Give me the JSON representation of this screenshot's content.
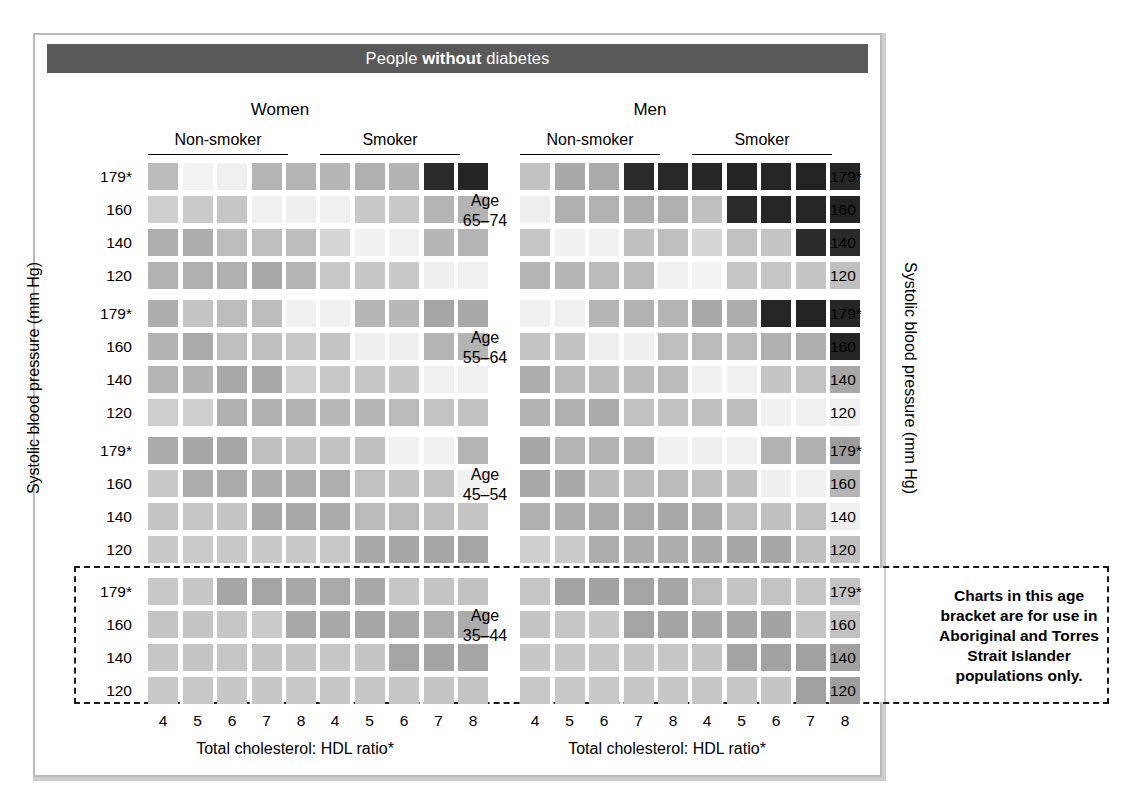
{
  "title": {
    "prefix": "People ",
    "emphasis": "without",
    "suffix": " diabetes",
    "full": "People without diabetes",
    "bar_color": "#595959"
  },
  "axes": {
    "y_title_left": "Systolic blood pressure (mm Hg)",
    "y_title_right": "Systolic blood pressure (mm Hg)",
    "x_title_women": "Total cholesterol: HDL ratio*",
    "x_title_men": "Total cholesterol: HDL ratio*",
    "y_ticks": [
      "179*",
      "160",
      "140",
      "120"
    ],
    "x_ticks": [
      "4",
      "5",
      "6",
      "7",
      "8"
    ]
  },
  "sex_headers": [
    {
      "label": "Women"
    },
    {
      "label": "Men"
    }
  ],
  "smoking_headers": [
    {
      "label": "Non-smoker"
    },
    {
      "label": "Smoker"
    },
    {
      "label": "Non-smoker"
    },
    {
      "label": "Smoker"
    }
  ],
  "age_groups": [
    {
      "line1": "Age",
      "line2": "65–74"
    },
    {
      "line1": "Age",
      "line2": "55–64"
    },
    {
      "line1": "Age",
      "line2": "45–54"
    },
    {
      "line1": "Age",
      "line2": "35–44"
    }
  ],
  "note": {
    "text": "Charts in this age bracket are for use in Aboriginal and Torres Strait Islander populations only.",
    "line1": "Charts in this age",
    "line2": "bracket are for use in",
    "line3": "Aboriginal and Torres",
    "line4": "Strait Islander",
    "line5": "populations only."
  },
  "risk_palette": {
    "note": "Grayscale risk bands as rendered in this scanned chart, lightest (lowest risk) to darkest (highest risk)",
    "levels": [
      "#f2f2f2",
      "#e8e8e8",
      "#d8d8d8",
      "#c9c9c9",
      "#bcbcbc",
      "#ababab",
      "#9b9b9b",
      "#8c8c8c",
      "#2e2e2e",
      "#232323"
    ]
  },
  "chart_data": {
    "type": "heatmap",
    "title": "People without diabetes",
    "xlabel": "Total cholesterol: HDL ratio*",
    "ylabel": "Systolic blood pressure (mm Hg)",
    "x": [
      "4",
      "5",
      "6",
      "7",
      "8"
    ],
    "y": [
      "179*",
      "160",
      "140",
      "120"
    ],
    "grid": false,
    "legend": "none",
    "value_scale": "cell fill is a grayscale risk shade; value = hex fill sampled from the scan",
    "panels": [
      {
        "sex": "Women",
        "smoking": "Non-smoker",
        "age": "65–74",
        "rows": [
          {
            "sbp": "179*",
            "cells": [
              "#bcbcbc",
              "#f2f2f2",
              "#f0f0f0",
              "#b4b4b4",
              "#b4b4b4"
            ]
          },
          {
            "sbp": "160",
            "cells": [
              "#cfcfcf",
              "#cacaca",
              "#c6c6c6",
              "#f0f0f0",
              "#efefef"
            ]
          },
          {
            "sbp": "140",
            "cells": [
              "#aeaeae",
              "#adadad",
              "#bdbdbd",
              "#bfbfbf",
              "#bdbdbd"
            ]
          },
          {
            "sbp": "120",
            "cells": [
              "#b2b2b2",
              "#b0b0b0",
              "#b0b0b0",
              "#a8a8a8",
              "#b4b4b4"
            ]
          }
        ]
      },
      {
        "sex": "Women",
        "smoking": "Smoker",
        "age": "65–74",
        "rows": [
          {
            "sbp": "179*",
            "cells": [
              "#b6b6b6",
              "#b0b0b0",
              "#b3b3b3",
              "#2b2b2b",
              "#252525"
            ]
          },
          {
            "sbp": "160",
            "cells": [
              "#f0f0f0",
              "#c8c8c8",
              "#c8c8c8",
              "#b4b4b4",
              "#b3b3b3"
            ]
          },
          {
            "sbp": "140",
            "cells": [
              "#d6d6d6",
              "#f1f1f1",
              "#f0f0f0",
              "#b6b6b6",
              "#b4b4b4"
            ]
          },
          {
            "sbp": "120",
            "cells": [
              "#c8c8c8",
              "#c7c7c7",
              "#c9c9c9",
              "#efefef",
              "#f0f0f0"
            ]
          }
        ]
      },
      {
        "sex": "Men",
        "smoking": "Non-smoker",
        "age": "65–74",
        "rows": [
          {
            "sbp": "179*",
            "cells": [
              "#c2c2c2",
              "#a9a9a9",
              "#ababab",
              "#2b2b2b",
              "#282828"
            ]
          },
          {
            "sbp": "160",
            "cells": [
              "#eeeeee",
              "#b0b0b0",
              "#b1b1b1",
              "#aeaeae",
              "#b0b0b0"
            ]
          },
          {
            "sbp": "140",
            "cells": [
              "#c6c6c6",
              "#f1f1f1",
              "#f1f1f1",
              "#c0c0c0",
              "#bebebe"
            ]
          },
          {
            "sbp": "120",
            "cells": [
              "#b5b5b5",
              "#b6b6b6",
              "#bababa",
              "#bababa",
              "#f1f1f1"
            ]
          }
        ]
      },
      {
        "sex": "Men",
        "smoking": "Smoker",
        "age": "65–74",
        "rows": [
          {
            "sbp": "179*",
            "cells": [
              "#272727",
              "#242424",
              "#262626",
              "#232323",
              "#252525"
            ]
          },
          {
            "sbp": "160",
            "cells": [
              "#c0c0c0",
              "#2a2a2a",
              "#262626",
              "#272727",
              "#242424"
            ]
          },
          {
            "sbp": "140",
            "cells": [
              "#d6d6d6",
              "#c1c1c1",
              "#c4c4c4",
              "#2b2b2b",
              "#2a2a2a"
            ]
          },
          {
            "sbp": "120",
            "cells": [
              "#f3f3f3",
              "#c6c6c6",
              "#c6c6c6",
              "#c4c4c4",
              "#c0c0c0"
            ]
          }
        ]
      },
      {
        "sex": "Women",
        "smoking": "Non-smoker",
        "age": "55–64",
        "rows": [
          {
            "sbp": "179*",
            "cells": [
              "#adadad",
              "#c4c4c4",
              "#bdbdbd",
              "#bdbdbd",
              "#f1f1f1"
            ]
          },
          {
            "sbp": "160",
            "cells": [
              "#b3b3b3",
              "#aaaaaa",
              "#bfbfbf",
              "#c0c0c0",
              "#c8c8c8"
            ]
          },
          {
            "sbp": "140",
            "cells": [
              "#b4b4b4",
              "#b3b3b3",
              "#a8a8a8",
              "#a8a8a8",
              "#d0d0d0"
            ]
          },
          {
            "sbp": "120",
            "cells": [
              "#cdcdcd",
              "#cfcfcf",
              "#b0b0b0",
              "#b0b0b0",
              "#b2b2b2"
            ]
          }
        ]
      },
      {
        "sex": "Women",
        "smoking": "Smoker",
        "age": "55–64",
        "rows": [
          {
            "sbp": "179*",
            "cells": [
              "#f1f1f1",
              "#b6b6b6",
              "#b8b8b8",
              "#a6a6a6",
              "#a9a9a9"
            ]
          },
          {
            "sbp": "160",
            "cells": [
              "#c4c4c4",
              "#efefef",
              "#efefef",
              "#b5b5b5",
              "#b4b4b4"
            ]
          },
          {
            "sbp": "140",
            "cells": [
              "#c8c8c8",
              "#c6c6c6",
              "#c7c7c7",
              "#f0f0f0",
              "#f0f0f0"
            ]
          },
          {
            "sbp": "120",
            "cells": [
              "#b8b8b8",
              "#b6b6b6",
              "#b9b9b9",
              "#c3c3c3",
              "#c2c2c2"
            ]
          }
        ]
      },
      {
        "sex": "Men",
        "smoking": "Non-smoker",
        "age": "55–64",
        "rows": [
          {
            "sbp": "179*",
            "cells": [
              "#f1f1f1",
              "#f0f0f0",
              "#b5b5b5",
              "#b2b2b2",
              "#b4b4b4"
            ]
          },
          {
            "sbp": "160",
            "cells": [
              "#c4c4c4",
              "#c2c2c2",
              "#eeeeee",
              "#efefef",
              "#bebebe"
            ]
          },
          {
            "sbp": "140",
            "cells": [
              "#adadad",
              "#bababa",
              "#bcbcbc",
              "#bcbcbc",
              "#bababa"
            ]
          },
          {
            "sbp": "120",
            "cells": [
              "#b3b3b3",
              "#afafaf",
              "#aaaaaa",
              "#c1c1c1",
              "#c2c2c2"
            ]
          }
        ]
      },
      {
        "sex": "Men",
        "smoking": "Smoker",
        "age": "55–64",
        "rows": [
          {
            "sbp": "179*",
            "cells": [
              "#a8a8a8",
              "#adadad",
              "#262626",
              "#232323",
              "#252525"
            ]
          },
          {
            "sbp": "160",
            "cells": [
              "#bababa",
              "#bababa",
              "#b0b0b0",
              "#aeaeae",
              "#242424"
            ]
          },
          {
            "sbp": "140",
            "cells": [
              "#f1f1f1",
              "#f0f0f0",
              "#c4c4c4",
              "#c3c3c3",
              "#a8a8a8"
            ]
          },
          {
            "sbp": "120",
            "cells": [
              "#c0c0c0",
              "#bdbdbd",
              "#f1f1f1",
              "#f0f0f0",
              "#f0f0f0"
            ]
          }
        ]
      },
      {
        "sex": "Women",
        "smoking": "Non-smoker",
        "age": "45–54",
        "rows": [
          {
            "sbp": "179*",
            "cells": [
              "#ababab",
              "#a7a7a7",
              "#a5a5a5",
              "#c0c0c0",
              "#c2c2c2"
            ]
          },
          {
            "sbp": "160",
            "cells": [
              "#c8c8c8",
              "#acacac",
              "#aaaaaa",
              "#adadad",
              "#acacac"
            ]
          },
          {
            "sbp": "140",
            "cells": [
              "#c5c5c5",
              "#c6c6c6",
              "#c5c5c5",
              "#a9a9a9",
              "#a9a9a9"
            ]
          },
          {
            "sbp": "120",
            "cells": [
              "#c9c9c9",
              "#cacaca",
              "#c8c8c8",
              "#c9c9c9",
              "#c8c8c8"
            ]
          }
        ]
      },
      {
        "sex": "Women",
        "smoking": "Smoker",
        "age": "45–54",
        "rows": [
          {
            "sbp": "179*",
            "cells": [
              "#c2c2c2",
              "#c0c0c0",
              "#f1f1f1",
              "#f0f0f0",
              "#b5b5b5"
            ]
          },
          {
            "sbp": "160",
            "cells": [
              "#aeaeae",
              "#c1c1c1",
              "#c2c2c2",
              "#c2c2c2",
              "#f1f1f1"
            ]
          },
          {
            "sbp": "140",
            "cells": [
              "#ababab",
              "#b9b9b9",
              "#b9b9b9",
              "#bfbfbf",
              "#c4c4c4"
            ]
          },
          {
            "sbp": "120",
            "cells": [
              "#c8c8c8",
              "#a9a9a9",
              "#a7a7a7",
              "#a6a6a6",
              "#a5a5a5"
            ]
          }
        ]
      },
      {
        "sex": "Men",
        "smoking": "Non-smoker",
        "age": "45–54",
        "rows": [
          {
            "sbp": "179*",
            "cells": [
              "#a7a7a7",
              "#b4b4b4",
              "#b3b3b3",
              "#b2b2b2",
              "#f1f1f1"
            ]
          },
          {
            "sbp": "160",
            "cells": [
              "#a9a9a9",
              "#a9a9a9",
              "#bcbcbc",
              "#bcbcbc",
              "#bababa"
            ]
          },
          {
            "sbp": "140",
            "cells": [
              "#b0b0b0",
              "#adadad",
              "#ababab",
              "#aaaaaa",
              "#a9a9a9"
            ]
          },
          {
            "sbp": "120",
            "cells": [
              "#cfcfcf",
              "#cacaca",
              "#acacac",
              "#adadad",
              "#acacac"
            ]
          }
        ]
      },
      {
        "sex": "Men",
        "smoking": "Smoker",
        "age": "45–54",
        "rows": [
          {
            "sbp": "179*",
            "cells": [
              "#eeeeee",
              "#f0f0f0",
              "#b1b1b1",
              "#b0b0b0",
              "#9d9d9d"
            ]
          },
          {
            "sbp": "160",
            "cells": [
              "#c0c0c0",
              "#c0c0c0",
              "#efefef",
              "#f0f0f0",
              "#b5b5b5"
            ]
          },
          {
            "sbp": "140",
            "cells": [
              "#acacac",
              "#bebebe",
              "#c0c0c0",
              "#c1c1c1",
              "#f0f0f0"
            ]
          },
          {
            "sbp": "120",
            "cells": [
              "#aaaaaa",
              "#a6a6a6",
              "#a6a6a6",
              "#bfbfbf",
              "#c0c0c0"
            ]
          }
        ]
      },
      {
        "sex": "Women",
        "smoking": "Non-smoker",
        "age": "35–44",
        "rows": [
          {
            "sbp": "179*",
            "cells": [
              "#c8c8c8",
              "#c7c7c7",
              "#a6a6a6",
              "#a5a5a5",
              "#a8a8a8"
            ]
          },
          {
            "sbp": "160",
            "cells": [
              "#c4c4c4",
              "#c5c5c5",
              "#c6c6c6",
              "#cacaca",
              "#a8a8a8"
            ]
          },
          {
            "sbp": "140",
            "cells": [
              "#c6c6c6",
              "#c5c5c5",
              "#c6c6c6",
              "#c5c5c5",
              "#c4c4c4"
            ]
          },
          {
            "sbp": "120",
            "cells": [
              "#c8c8c8",
              "#c8c8c8",
              "#c7c7c7",
              "#c7c7c7",
              "#c8c8c8"
            ]
          }
        ]
      },
      {
        "sex": "Women",
        "smoking": "Smoker",
        "age": "35–44",
        "rows": [
          {
            "sbp": "179*",
            "cells": [
              "#aaaaaa",
              "#a9a9a9",
              "#c6c6c6",
              "#c4c4c4",
              "#c2c2c2"
            ]
          },
          {
            "sbp": "160",
            "cells": [
              "#a9a9a9",
              "#a7a7a7",
              "#a8a8a8",
              "#aeaeae",
              "#acacac"
            ]
          },
          {
            "sbp": "140",
            "cells": [
              "#c6c6c6",
              "#c5c5c5",
              "#a5a5a5",
              "#a4a4a4",
              "#a6a6a6"
            ]
          },
          {
            "sbp": "120",
            "cells": [
              "#c7c7c7",
              "#c6c6c6",
              "#c6c6c6",
              "#c5c5c5",
              "#c4c4c4"
            ]
          }
        ]
      },
      {
        "sex": "Men",
        "smoking": "Non-smoker",
        "age": "35–44",
        "rows": [
          {
            "sbp": "179*",
            "cells": [
              "#c6c6c6",
              "#a4a4a4",
              "#a3a3a3",
              "#a5a5a5",
              "#a6a6a6"
            ]
          },
          {
            "sbp": "160",
            "cells": [
              "#c5c5c5",
              "#c6c6c6",
              "#c7c7c7",
              "#a5a5a5",
              "#a4a4a4"
            ]
          },
          {
            "sbp": "140",
            "cells": [
              "#c7c7c7",
              "#c6c6c6",
              "#c6c6c6",
              "#c5c5c5",
              "#c6c6c6"
            ]
          },
          {
            "sbp": "120",
            "cells": [
              "#c8c8c8",
              "#c8c8c8",
              "#c8c8c8",
              "#c7c7c7",
              "#c7c7c7"
            ]
          }
        ]
      },
      {
        "sex": "Men",
        "smoking": "Smoker",
        "age": "35–44",
        "rows": [
          {
            "sbp": "179*",
            "cells": [
              "#bebebe",
              "#c4c4c4",
              "#c3c3c3",
              "#c6c6c6",
              "#c4c4c4"
            ]
          },
          {
            "sbp": "160",
            "cells": [
              "#a8a8a8",
              "#a7a7a7",
              "#a3a3a3",
              "#c4c4c4",
              "#c3c3c3"
            ]
          },
          {
            "sbp": "140",
            "cells": [
              "#c5c5c5",
              "#a4a4a4",
              "#a2a2a2",
              "#a1a1a1",
              "#a0a0a0"
            ]
          },
          {
            "sbp": "120",
            "cells": [
              "#c6c6c6",
              "#c6c6c6",
              "#c5c5c5",
              "#a0a0a0",
              "#9f9f9f"
            ]
          }
        ]
      }
    ]
  }
}
